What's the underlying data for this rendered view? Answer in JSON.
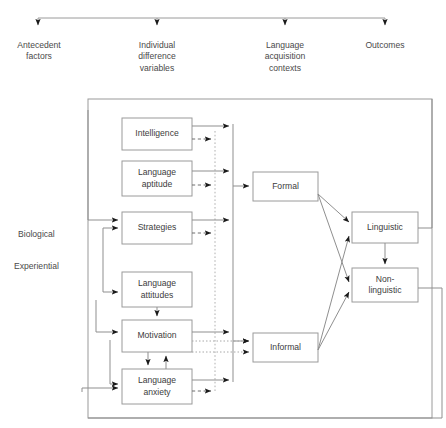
{
  "figure": {
    "type": "flow-diagram",
    "title_bar": {
      "name": "top-distributor-bar",
      "left_x": 38,
      "right_x": 385,
      "y": 18,
      "arrow_targets": [
        38,
        157,
        285,
        385
      ]
    },
    "columns": [
      {
        "id": "antecedent",
        "lines": [
          "Antecedent",
          "factors"
        ],
        "x": 38
      },
      {
        "id": "individual",
        "lines": [
          "Individual",
          "difference",
          "variables"
        ],
        "x": 157
      },
      {
        "id": "contexts",
        "lines": [
          "Language",
          "acquisition",
          "contexts"
        ],
        "x": 285
      },
      {
        "id": "outcomes",
        "lines": [
          "Outcomes"
        ],
        "x": 385
      }
    ],
    "side_labels": [
      {
        "id": "biological",
        "text": "Biological",
        "x": 18,
        "y": 234
      },
      {
        "id": "experiential",
        "text": "Experiential",
        "x": 14,
        "y": 266
      }
    ],
    "boxes": [
      {
        "id": "intelligence",
        "lines": [
          "Intelligence"
        ],
        "x": 122,
        "y": 118,
        "w": 70,
        "h": 32
      },
      {
        "id": "language-aptitude",
        "lines": [
          "Language",
          "aptitude"
        ],
        "x": 122,
        "y": 161,
        "w": 70,
        "h": 35
      },
      {
        "id": "strategies",
        "lines": [
          "Strategies"
        ],
        "x": 122,
        "y": 212,
        "w": 70,
        "h": 32
      },
      {
        "id": "language-attitudes",
        "lines": [
          "Language",
          "attitudes"
        ],
        "x": 122,
        "y": 272,
        "w": 70,
        "h": 35
      },
      {
        "id": "motivation",
        "lines": [
          "Motivation"
        ],
        "x": 122,
        "y": 320,
        "w": 70,
        "h": 32
      },
      {
        "id": "language-anxiety",
        "lines": [
          "Language",
          "anxiety"
        ],
        "x": 122,
        "y": 369,
        "w": 70,
        "h": 35
      },
      {
        "id": "formal",
        "lines": [
          "Formal"
        ],
        "x": 253,
        "y": 172,
        "w": 65,
        "h": 29
      },
      {
        "id": "informal",
        "lines": [
          "Informal"
        ],
        "x": 253,
        "y": 333,
        "w": 65,
        "h": 29
      },
      {
        "id": "linguistic",
        "lines": [
          "Linguistic"
        ],
        "x": 352,
        "y": 212,
        "w": 66,
        "h": 31
      },
      {
        "id": "non-linguistic",
        "lines": [
          "Non-",
          "linguistic"
        ],
        "x": 352,
        "y": 268,
        "w": 66,
        "h": 34
      }
    ],
    "outer_frame": {
      "x": 88,
      "y": 99,
      "w": 344,
      "h": 319
    },
    "colors": {
      "stroke": "#8a8a8a",
      "box_stroke": "#9a9a9a",
      "text": "#3c3c3c",
      "arrow_head": "#1a1a1a",
      "dotted": "#a8a8a8",
      "background": "#ffffff"
    }
  }
}
